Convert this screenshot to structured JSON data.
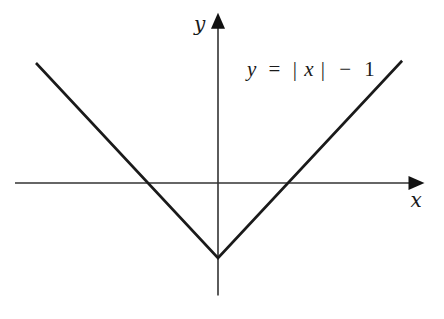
{
  "chart_data": {
    "type": "line",
    "title": "",
    "function_label": "y = |x| − 1",
    "equation": {
      "lhs": "y",
      "eq": "=",
      "abs_open": "|",
      "var": "x",
      "abs_close": "|",
      "minus": "−",
      "const": "1"
    },
    "xlabel": "x",
    "ylabel": "y",
    "xlim": [
      -2.9,
      2.95
    ],
    "ylim": [
      -1.5,
      2.27
    ],
    "grid": false,
    "ticks": false,
    "series": [
      {
        "name": "y = |x| - 1",
        "points": [
          [
            -2.6,
            1.6
          ],
          [
            0,
            -1
          ],
          [
            2.63,
            1.63
          ]
        ]
      }
    ],
    "key_points": {
      "vertex": [
        0,
        -1
      ],
      "x_intercepts": [
        -1,
        1
      ]
    },
    "colors": {
      "line": "#1a1a1a",
      "axes": "#333333"
    }
  }
}
